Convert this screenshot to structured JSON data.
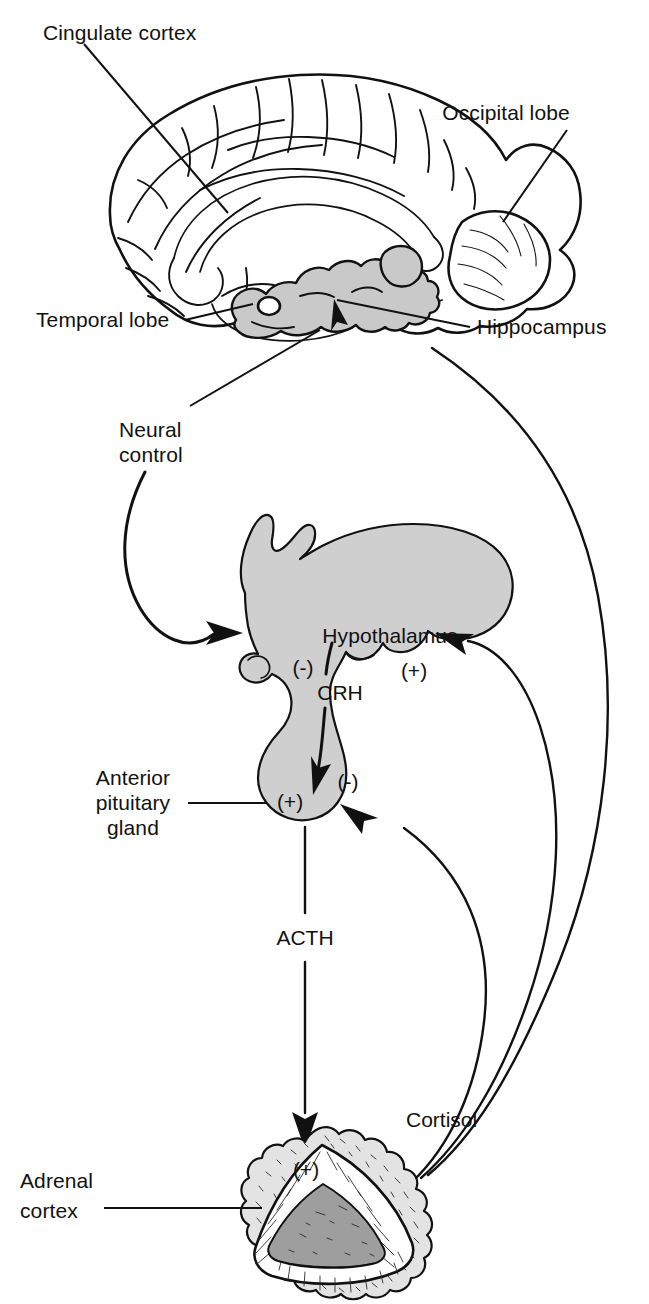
{
  "figure": {
    "background_color": "#ffffff",
    "line_color": "#111111",
    "shade_color": "#cfcfcf"
  },
  "brain": {
    "labels": {
      "cingulate_cortex": "Cingulate cortex",
      "occipital_lobe": "Occipital lobe",
      "temporal_lobe": "Temporal lobe",
      "hippocampus": "Hippocampus"
    }
  },
  "pathway": {
    "neural_control": "Neural control",
    "neural_control_line1": "Neural",
    "neural_control_line2": "control",
    "hypothalamus": "Hypothalamus",
    "crh": "CRH",
    "acth": "ACTH",
    "cortisol": "Cortisol",
    "anterior_pituitary_line1": "Anterior",
    "anterior_pituitary_line2": "pituitary",
    "anterior_pituitary_line3": "gland",
    "adrenal_cortex_line1": "Adrenal",
    "adrenal_cortex_line2": "cortex"
  },
  "signs": {
    "hypothalamus_negative": "(-)",
    "hypothalamus_positive": "(+)",
    "pituitary_positive": "(+)",
    "pituitary_negative": "(-)",
    "adrenal_positive": "(+)"
  }
}
